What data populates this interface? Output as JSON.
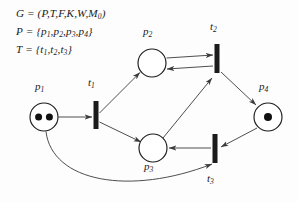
{
  "figure": {
    "kind": "petri-net",
    "background_color": "#fdfdfd",
    "ink_color": "#1b1b1b",
    "stroke_color": "#3a3a3a"
  },
  "definition": {
    "line1": {
      "lhs": "G",
      "eq": "=",
      "rhs": "(P,T,F,K,W,M",
      "sub": "0",
      "close": ")",
      "full": "G = (P,T,F,K,W,M0)"
    },
    "line2": {
      "lhs": "P",
      "eq": "=",
      "open": "{",
      "items": [
        "p1",
        "p2",
        "p3",
        "p4"
      ],
      "close": "}",
      "full": "P = {p1,p2,p3,p4}"
    },
    "line3": {
      "lhs": "T",
      "eq": "=",
      "open": "{",
      "items": [
        "t1",
        "t2",
        "t3"
      ],
      "close": "}",
      "full": "T = {t1,t2,t3}"
    }
  },
  "places": [
    {
      "id": "p1",
      "base": "p",
      "index": "1",
      "cx": 44,
      "cy": 117,
      "r": 14,
      "tokens": 2,
      "label_x": 35,
      "label_y": 88
    },
    {
      "id": "p2",
      "base": "p",
      "index": "2",
      "cx": 152,
      "cy": 63,
      "r": 14,
      "tokens": 0,
      "label_x": 143,
      "label_y": 33
    },
    {
      "id": "p3",
      "base": "p",
      "index": "3",
      "cx": 153,
      "cy": 148,
      "r": 14,
      "tokens": 0,
      "label_x": 144,
      "label_y": 168
    },
    {
      "id": "p4",
      "base": "p",
      "index": "4",
      "cx": 268,
      "cy": 117,
      "r": 14,
      "tokens": 1,
      "label_x": 259,
      "label_y": 88
    }
  ],
  "transitions": [
    {
      "id": "t1",
      "base": "t",
      "index": "1",
      "x": 96,
      "y_top": 101,
      "y_bottom": 129,
      "width": 5,
      "label_x": 88,
      "label_y": 84
    },
    {
      "id": "t2",
      "base": "t",
      "index": "2",
      "x": 217,
      "y_top": 44,
      "y_bottom": 73,
      "width": 5,
      "label_x": 210,
      "label_y": 28
    },
    {
      "id": "t3",
      "base": "t",
      "index": "3",
      "x": 215,
      "y_top": 134,
      "y_bottom": 163,
      "width": 5,
      "label_x": 207,
      "label_y": 180
    }
  ],
  "arcs": [
    {
      "id": "p1-t1",
      "from": "p1",
      "to": "t1",
      "shape": "straight"
    },
    {
      "id": "t1-p2",
      "from": "t1",
      "to": "p2",
      "shape": "straight"
    },
    {
      "id": "t1-p3",
      "from": "t1",
      "to": "p3",
      "shape": "straight"
    },
    {
      "id": "p2-t2",
      "from": "p2",
      "to": "t2",
      "shape": "straight"
    },
    {
      "id": "t2-p2",
      "from": "t2",
      "to": "p2",
      "shape": "straight"
    },
    {
      "id": "t2-p4",
      "from": "t2",
      "to": "p4",
      "shape": "straight"
    },
    {
      "id": "p4-t3",
      "from": "p4",
      "to": "t3",
      "shape": "straight"
    },
    {
      "id": "t3-p3",
      "from": "t3",
      "to": "p3",
      "shape": "straight"
    },
    {
      "id": "p3-t2",
      "from": "p3",
      "to": "t2",
      "shape": "straight"
    },
    {
      "id": "p1-t3",
      "from": "p1",
      "to": "t3",
      "shape": "curved"
    }
  ]
}
